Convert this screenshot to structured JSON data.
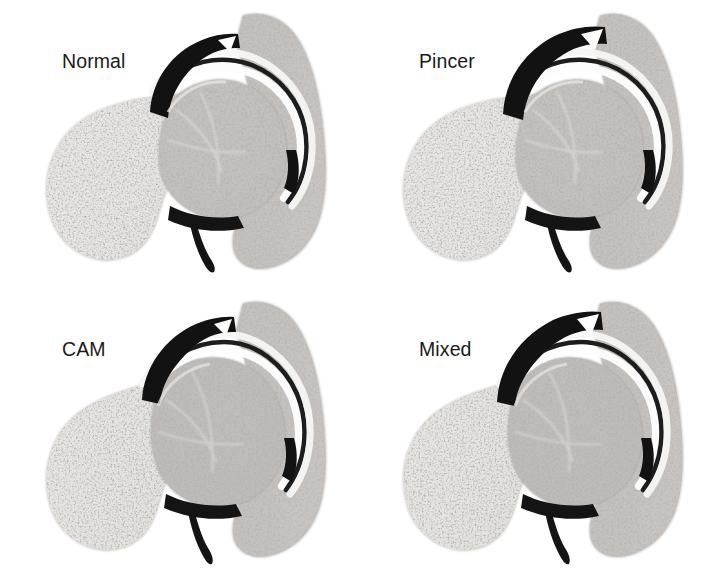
{
  "figure": {
    "background_color": "#ffffff",
    "width": 714,
    "height": 576,
    "layout": "2x2 grid of grayscale hip joint cross-section illustrations"
  },
  "palette": {
    "background": "#ffffff",
    "bone_light": "#f0eeec",
    "bone_mid": "#c9c5c2",
    "bone_dark": "#9a9693",
    "trabecular_speck": "#6d6a67",
    "cortex_outline": "#b8b4b1",
    "cartilage_white": "#fdfdfd",
    "labrum_black": "#121212",
    "joint_space": "#1a1a1a",
    "label_text": "#1a1a1a"
  },
  "panels": [
    {
      "id": "normal",
      "label": "Normal",
      "position": "top-left",
      "x": 0,
      "y": 0,
      "features": {
        "femoral_head": "spherical",
        "head_neck_offset": "normal concave waist",
        "acetabular_coverage": "normal",
        "labrum": "intact dark crescent at rim",
        "joint_space": "uniform"
      }
    },
    {
      "id": "pincer",
      "label": "Pincer",
      "position": "top-right",
      "x": 357,
      "y": 0,
      "features": {
        "femoral_head": "spherical",
        "head_neck_offset": "normal concave waist",
        "acetabular_coverage": "over-coverage, rim extends laterally over head",
        "labrum": "compressed dark labrum under prominent rim",
        "joint_space": "uniform"
      }
    },
    {
      "id": "cam",
      "label": "CAM",
      "position": "bottom-left",
      "x": 0,
      "y": 288,
      "features": {
        "femoral_head": "aspherical, pistol-grip bump",
        "head_neck_offset": "reduced / flattened anterolateral junction",
        "acetabular_coverage": "normal",
        "labrum": "intact dark crescent at rim",
        "joint_space": "uniform"
      }
    },
    {
      "id": "mixed",
      "label": "Mixed",
      "position": "bottom-right",
      "x": 357,
      "y": 288,
      "features": {
        "femoral_head": "aspherical, pistol-grip bump",
        "head_neck_offset": "reduced / flattened anterolateral junction",
        "acetabular_coverage": "over-coverage, prominent rim",
        "labrum": "compressed dark labrum under prominent rim",
        "joint_space": "uniform"
      }
    }
  ]
}
